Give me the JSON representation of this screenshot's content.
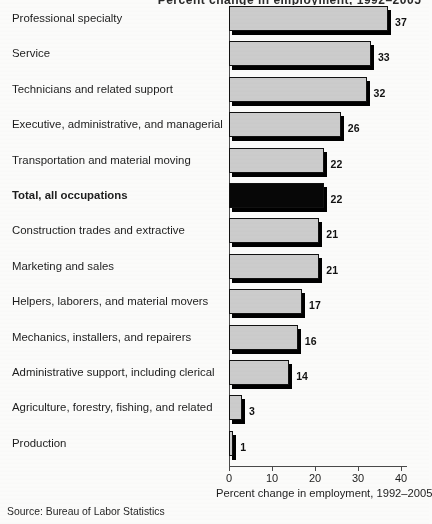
{
  "chart_data": {
    "type": "bar",
    "orientation": "horizontal",
    "title": "Percent change in employment, 1992–2005",
    "xlabel": "Percent change in employment, 1992–2005",
    "ylabel": "",
    "xlim": [
      0,
      43
    ],
    "xticks": [
      0,
      10,
      20,
      30,
      40
    ],
    "xtick_labels": [
      "0",
      "10",
      "20",
      "30",
      "40"
    ],
    "grid": false,
    "legend": "none",
    "source": "Source: Bureau of Labor Statistics",
    "categories": [
      "Professional specialty",
      "Service",
      "Technicians and related support",
      "Executive, administrative, and managerial",
      "Transportation and material moving",
      "Total, all occupations",
      "Construction trades and extractive",
      "Marketing and sales",
      "Helpers, laborers, and material movers",
      "Mechanics, installers, and repairers",
      "Administrative support, including clerical",
      "Agriculture, forestry, fishing, and related",
      "Production"
    ],
    "values": [
      37,
      33,
      32,
      26,
      22,
      22,
      21,
      21,
      17,
      16,
      14,
      3,
      1
    ],
    "value_labels": [
      "37",
      "33",
      "32",
      "26",
      "22",
      "22",
      "21",
      "21",
      "17",
      "16",
      "14",
      "3",
      "1"
    ],
    "highlight_category": "Total, all occupations",
    "colors": {
      "bar_fill": "#cccccc",
      "bar_edge": "#111111",
      "bar_shadow": "#000000",
      "highlight_fill": "#070707",
      "background": "#fbfbfa",
      "axis": "#4a4a4a",
      "text": "#1d1d1d"
    }
  },
  "figure": {
    "title_fragment": "Percent change in employment, 1992–2005",
    "source_note": "Source: Bureau of Labor Statistics",
    "axis_title": "Percent change in employment, 1992–2005"
  }
}
